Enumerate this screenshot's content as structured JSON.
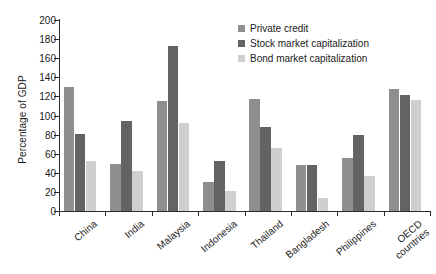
{
  "chart_data": {
    "type": "bar",
    "title": "",
    "xlabel": "",
    "ylabel": "Percentage of GDP",
    "ylim": [
      0,
      200
    ],
    "ytick_step": 20,
    "yticks": [
      0,
      20,
      40,
      60,
      80,
      100,
      120,
      140,
      160,
      180,
      200
    ],
    "grid": false,
    "legend_position": "top-right",
    "categories": [
      "China",
      "India",
      "Malaysia",
      "Indonesia",
      "Thailand",
      "Bangladesh",
      "Philippines",
      "OECD countries"
    ],
    "series": [
      {
        "name": "Private credit",
        "color": "#8e8e8e",
        "values": [
          130,
          49,
          115,
          30,
          117,
          48,
          56,
          128
        ]
      },
      {
        "name": "Stock market capitalization",
        "color": "#636363",
        "values": [
          81,
          94,
          173,
          52,
          88,
          48,
          80,
          121
        ]
      },
      {
        "name": "Bond market capitalization",
        "color": "#cfcfcf",
        "values": [
          52,
          42,
          92,
          21,
          66,
          14,
          37,
          116
        ]
      }
    ]
  },
  "legend": {
    "items": [
      {
        "label": "Private credit",
        "key": "private"
      },
      {
        "label": "Stock market capitalization",
        "key": "stock"
      },
      {
        "label": "Bond market capitalization",
        "key": "bond"
      }
    ]
  },
  "axis": {
    "y_title": "Percentage of GDP"
  }
}
